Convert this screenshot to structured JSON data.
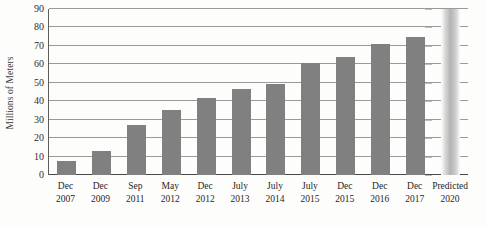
{
  "chart_data": {
    "type": "bar",
    "title": "",
    "subtitle": "",
    "xlabel": "",
    "ylabel": "Millions of Meters",
    "ylim": [
      0,
      90
    ],
    "ytick_step": 10,
    "yticks": [
      90,
      80,
      70,
      60,
      50,
      40,
      30,
      20,
      10,
      0
    ],
    "grid": true,
    "legend": "none",
    "bar_color": "#808080",
    "predicted_bar_color": "#b4b4b4",
    "categories": [
      "Dec 2007",
      "Dec 2009",
      "Sep 2011",
      "May 2012",
      "Dec 2012",
      "July 2013",
      "July 2014",
      "July 2015",
      "Dec 2015",
      "Dec 2016",
      "Dec 2017",
      "Predicted 2020"
    ],
    "category_lines": [
      {
        "line1": "Dec",
        "line2": "2007"
      },
      {
        "line1": "Dec",
        "line2": "2009"
      },
      {
        "line1": "Sep",
        "line2": "2011"
      },
      {
        "line1": "May",
        "line2": "2012"
      },
      {
        "line1": "Dec",
        "line2": "2012"
      },
      {
        "line1": "July",
        "line2": "2013"
      },
      {
        "line1": "July",
        "line2": "2014"
      },
      {
        "line1": "July",
        "line2": "2015"
      },
      {
        "line1": "Dec",
        "line2": "2015"
      },
      {
        "line1": "Dec",
        "line2": "2016"
      },
      {
        "line1": "Dec",
        "line2": "2017"
      },
      {
        "line1": "Predicted",
        "line2": "2020"
      }
    ],
    "values": [
      7.5,
      13,
      27,
      35.5,
      41.5,
      46.5,
      49.5,
      61,
      64,
      71,
      75,
      90
    ],
    "predicted_index": 11
  }
}
